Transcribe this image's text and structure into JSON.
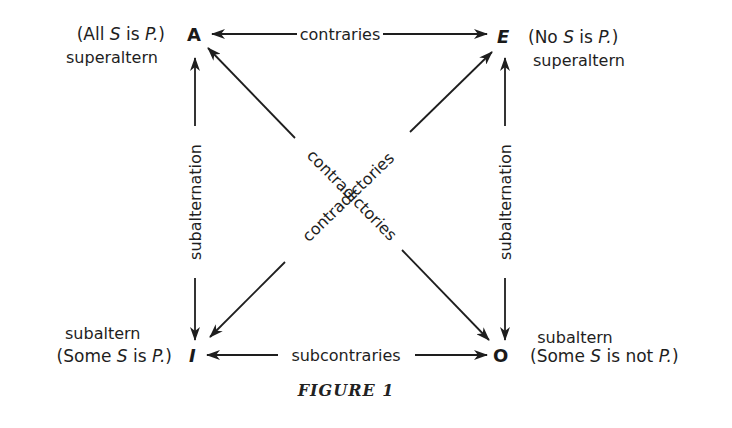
{
  "corners": {
    "A": {
      "letter": "A",
      "proposition_open": "(All ",
      "proposition_s": "S",
      "proposition_mid": " is ",
      "proposition_p": "P.",
      "proposition_close": ")",
      "role": "superaltern"
    },
    "E": {
      "letter": "E",
      "proposition_open": "(No ",
      "proposition_s": "S",
      "proposition_mid": " is ",
      "proposition_p": "P.",
      "proposition_close": ")",
      "role": "superaltern"
    },
    "I": {
      "letter": "I",
      "proposition_open": "(Some ",
      "proposition_s": "S",
      "proposition_mid": " is ",
      "proposition_p": "P.",
      "proposition_close": ")",
      "role": "subaltern"
    },
    "O": {
      "letter": "O",
      "proposition_open": "(Some ",
      "proposition_s": "S",
      "proposition_mid": " is not ",
      "proposition_p": "P.",
      "proposition_close": ")",
      "role": "subaltern"
    }
  },
  "relations": {
    "top": "contraries",
    "bottom": "subcontraries",
    "left": "subalternation",
    "right": "subalternation",
    "diagonal_a_o": "contradictories",
    "diagonal_e_i": "contradictories"
  },
  "caption": "FIGURE 1"
}
